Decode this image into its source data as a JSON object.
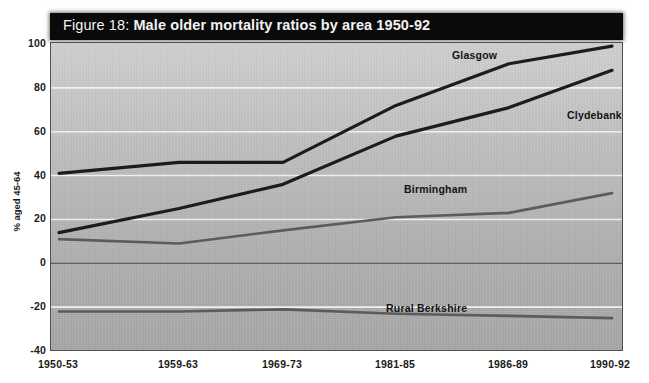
{
  "title": {
    "prefix": "Figure 18: ",
    "main": "Male older mortality ratios by area 1950-92",
    "full": "Figure 18: Male older mortality ratios by area 1950-92"
  },
  "chart_data": {
    "type": "line",
    "title": "Figure 18: Male older mortality ratios by area 1950-92",
    "xlabel": "",
    "ylabel": "% aged 45-64",
    "categories": [
      "1950-53",
      "1959-63",
      "1969-73",
      "1981-85",
      "1986-89",
      "1990-92"
    ],
    "ylim": [
      -40,
      100
    ],
    "yticks": [
      100,
      80,
      60,
      40,
      20,
      0,
      -20,
      -40
    ],
    "grid": true,
    "legend": "inline-labels",
    "series": [
      {
        "name": "Glasgow",
        "color": "#1c1c1c",
        "width": 3.2,
        "values": [
          41,
          46,
          46,
          72,
          91,
          99
        ],
        "label_x": 508,
        "label_y": 62,
        "label_anchor": "end",
        "label_dx": -12,
        "label_dy": -8
      },
      {
        "name": "Clydebank",
        "color": "#1c1c1c",
        "width": 3.2,
        "values": [
          14,
          25,
          36,
          58,
          71,
          88
        ],
        "label_x": 560,
        "label_y": 100,
        "label_anchor": "start",
        "label_dx": 6,
        "label_dy": 14
      },
      {
        "name": "Birmingham",
        "color": "#5c5c5c",
        "width": 2.6,
        "values": [
          11,
          9,
          15,
          21,
          23,
          32
        ],
        "label_x": 470,
        "label_y": 196,
        "label_anchor": "end",
        "label_dx": -4,
        "label_dy": -8
      },
      {
        "name": "Rural Berkshire",
        "color": "#5c5c5c",
        "width": 2.6,
        "values": [
          -22,
          -22,
          -21,
          -23,
          -24,
          -25
        ],
        "label_x": 470,
        "label_y": 315,
        "label_anchor": "end",
        "label_dx": -4,
        "label_dy": -8
      }
    ],
    "series_names": [
      "Glasgow",
      "Clydebank",
      "Birmingham",
      "Rural Berkshire"
    ]
  },
  "axis": {
    "y_title": "% aged 45-64",
    "y_tick_labels": [
      "100",
      "80",
      "60",
      "40",
      "20",
      "0",
      "-20",
      "-40"
    ],
    "x_tick_labels": [
      "1950-53",
      "1959-63",
      "1969-73",
      "1981-85",
      "1986-89",
      "1990-92"
    ]
  },
  "colors": {
    "title_bar_bg": "#0a0a0a",
    "title_text": "#f2f2f2",
    "plot_bg_top": "#d2d2d2",
    "plot_bg_bottom": "#a9a9a9",
    "gridline": "#f0f0f0",
    "zero_line": "#4a4a4a",
    "dark_series": "#1c1c1c",
    "mid_series": "#5c5c5c",
    "frame": "#4e4e4e"
  }
}
